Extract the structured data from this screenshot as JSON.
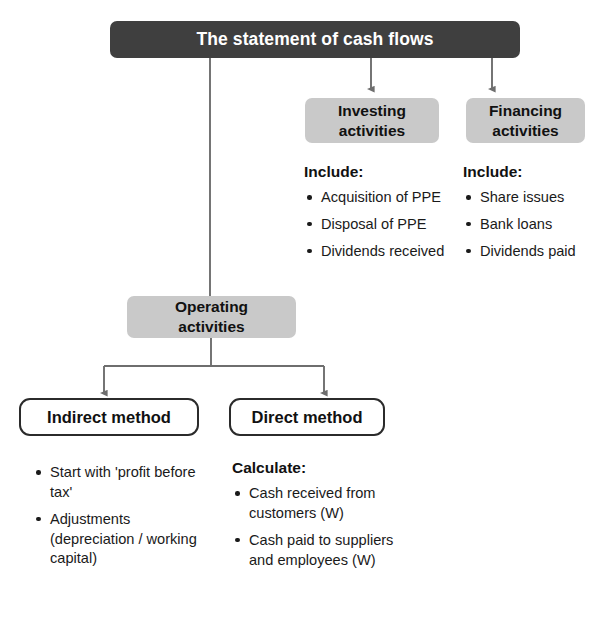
{
  "diagram": {
    "title": "The statement of cash flows",
    "nodes": {
      "investing": "Investing\nactivities",
      "financing": "Financing\nactivities",
      "operating": "Operating\nactivities",
      "indirect_method": "Indirect method",
      "direct_method": "Direct method"
    },
    "sections": {
      "investing_details": {
        "heading": "Include:",
        "items": [
          "Acquisition of PPE",
          "Disposal of PPE",
          "Dividends received"
        ]
      },
      "financing_details": {
        "heading": "Include:",
        "items": [
          "Share issues",
          "Bank loans",
          "Dividends paid"
        ]
      },
      "indirect_details": {
        "heading": "",
        "items": [
          "Start with 'profit before tax'",
          "Adjustments (depreciation / working capital)"
        ]
      },
      "direct_details": {
        "heading": "Calculate:",
        "items": [
          "Cash received from customers (W)",
          "Cash paid to suppliers and employees (W)"
        ]
      }
    },
    "colors": {
      "title_fill": "#3f3f3f",
      "title_text": "#ffffff",
      "node_fill": "#c9c9c9",
      "node_text": "#111111",
      "outline_stroke": "#2b2b2b",
      "connector": "#6e6e6e",
      "background": "#ffffff",
      "body_text": "#1a1a1a"
    }
  }
}
